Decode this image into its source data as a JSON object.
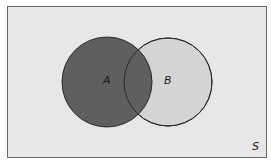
{
  "diagram": {
    "type": "venn",
    "universe_label": "S",
    "sets": [
      {
        "label": "A",
        "fill": "#5f5f5f",
        "cx": 107,
        "cy": 82,
        "r": 45
      },
      {
        "label": "B",
        "fill": "#d4d4d4",
        "cx": 168,
        "cy": 82,
        "r": 44
      }
    ],
    "shaded_region": "A",
    "colors": {
      "background": "#e7e7e7",
      "border": "#6a6a6a",
      "stroke": "#2a2a2a"
    }
  }
}
